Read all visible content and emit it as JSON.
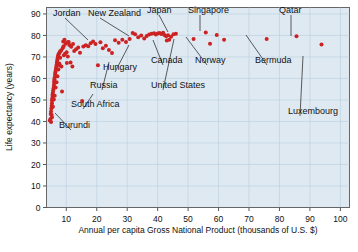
{
  "figure": {
    "title": "",
    "background_color": "#ffffff",
    "plot_background_color": "#dfe9f2",
    "point_color": "#cc2222",
    "grid_color": "#b9cfdd"
  },
  "chart_data": {
    "type": "scatter",
    "title": "",
    "xlabel": "Annual per capita Gross National Product (thousands of U.S. $)",
    "ylabel": "Life expectancy (years)",
    "xlim": [
      3.5,
      103
    ],
    "ylim": [
      0,
      93
    ],
    "xticks": [
      10,
      20,
      30,
      40,
      50,
      60,
      70,
      80,
      90,
      100
    ],
    "yticks": [
      0,
      10,
      20,
      30,
      40,
      50,
      60,
      70,
      80,
      90
    ],
    "grid": true,
    "legend": "none",
    "series": [
      {
        "name": "Countries",
        "points": [
          [
            4.6,
            40.5
          ],
          [
            4.8,
            41.2
          ],
          [
            4.9,
            43.5
          ],
          [
            5.0,
            44.6
          ],
          [
            5.1,
            46.0
          ],
          [
            5.2,
            47.3
          ],
          [
            5.3,
            48.5
          ],
          [
            5.3,
            49.8
          ],
          [
            5.4,
            50.8
          ],
          [
            5.5,
            51.8
          ],
          [
            5.5,
            52.6
          ],
          [
            5.6,
            53.4
          ],
          [
            5.7,
            54.4
          ],
          [
            5.8,
            55.3
          ],
          [
            5.9,
            56.5
          ],
          [
            6.0,
            57.6
          ],
          [
            6.0,
            58.6
          ],
          [
            6.1,
            59.6
          ],
          [
            6.2,
            60.6
          ],
          [
            6.3,
            61.8
          ],
          [
            6.4,
            62.8
          ],
          [
            6.5,
            63.6
          ],
          [
            6.6,
            64.5
          ],
          [
            6.7,
            65.3
          ],
          [
            6.8,
            66.3
          ],
          [
            6.9,
            67.3
          ],
          [
            7.0,
            68.2
          ],
          [
            7.1,
            69.0
          ],
          [
            7.2,
            69.8
          ],
          [
            7.3,
            70.4
          ],
          [
            7.4,
            71.0
          ],
          [
            7.6,
            71.6
          ],
          [
            7.8,
            72.1
          ],
          [
            8.0,
            72.6
          ],
          [
            8.3,
            73.0
          ],
          [
            5.2,
            43.0
          ],
          [
            5.6,
            46.8
          ],
          [
            5.9,
            50.2
          ],
          [
            6.2,
            52.0
          ],
          [
            6.5,
            55.8
          ],
          [
            6.8,
            58.2
          ],
          [
            7.1,
            61.0
          ],
          [
            7.4,
            64.2
          ],
          [
            7.7,
            67.0
          ],
          [
            8.0,
            69.6
          ],
          [
            8.6,
            53.9
          ],
          [
            9.2,
            70.8
          ],
          [
            9.6,
            71.5
          ],
          [
            10.1,
            72.2
          ],
          [
            10.5,
            70.2
          ],
          [
            9.0,
            77.2
          ],
          [
            9.4,
            78.0
          ],
          [
            9.8,
            76.2
          ],
          [
            10.4,
            76.8
          ],
          [
            11.0,
            75.6
          ],
          [
            11.6,
            74.8
          ],
          [
            12.0,
            65.6
          ],
          [
            12.6,
            72.8
          ],
          [
            13.2,
            73.6
          ],
          [
            13.9,
            74.4
          ],
          [
            14.5,
            72.0
          ],
          [
            15.2,
            49.5
          ],
          [
            15.6,
            74.9
          ],
          [
            16.4,
            75.4
          ],
          [
            17.2,
            75.0
          ],
          [
            18.0,
            76.4
          ],
          [
            18.8,
            77.2
          ],
          [
            19.6,
            76.0
          ],
          [
            20.4,
            66.2
          ],
          [
            21.2,
            76.8
          ],
          [
            22.0,
            74.0
          ],
          [
            23.0,
            75.2
          ],
          [
            24.0,
            73.2
          ],
          [
            25.0,
            71.8
          ],
          [
            26.0,
            77.8
          ],
          [
            27.2,
            76.6
          ],
          [
            28.4,
            78.0
          ],
          [
            29.6,
            77.0
          ],
          [
            30.8,
            78.4
          ],
          [
            31.8,
            81.2
          ],
          [
            32.6,
            80.6
          ],
          [
            33.6,
            79.2
          ],
          [
            34.6,
            80.0
          ],
          [
            35.6,
            78.6
          ],
          [
            36.4,
            79.8
          ],
          [
            37.2,
            80.4
          ],
          [
            38.0,
            80.8
          ],
          [
            38.8,
            81.0
          ],
          [
            39.4,
            80.5
          ],
          [
            40.0,
            80.9
          ],
          [
            40.6,
            81.1
          ],
          [
            41.2,
            80.7
          ],
          [
            41.8,
            81.3
          ],
          [
            42.2,
            80.2
          ],
          [
            42.8,
            79.6
          ],
          [
            43.4,
            80.1
          ],
          [
            43.8,
            78.0
          ],
          [
            44.4,
            79.4
          ],
          [
            45.2,
            80.6
          ],
          [
            46.0,
            80.8
          ],
          [
            43.0,
            77.6
          ],
          [
            51.8,
            78.4
          ],
          [
            55.8,
            81.4
          ],
          [
            57.2,
            76.2
          ],
          [
            59.4,
            80.2
          ],
          [
            61.8,
            78.0
          ],
          [
            75.8,
            78.4
          ],
          [
            85.6,
            79.6
          ],
          [
            93.8,
            75.8
          ],
          [
            8.8,
            74.0
          ],
          [
            9.1,
            75.0
          ],
          [
            10.8,
            77.0
          ],
          [
            12.2,
            76.0
          ],
          [
            7.9,
            66.0
          ],
          [
            8.4,
            65.6
          ],
          [
            10.2,
            67.2
          ],
          [
            11.4,
            67.4
          ],
          [
            5.0,
            39.8
          ],
          [
            5.3,
            42.0
          ]
        ]
      }
    ],
    "annotations": [
      {
        "label": "Jordan",
        "lx": 53,
        "ly": 16,
        "px": 88,
        "py": 40
      },
      {
        "label": "New Zealand",
        "lx": 88,
        "ly": 16,
        "px": 129,
        "py": 36
      },
      {
        "label": "Japan",
        "lx": 147,
        "ly": 13,
        "px": 168,
        "py": 32
      },
      {
        "label": "Singapore",
        "lx": 188,
        "ly": 13,
        "px": 200,
        "py": 31
      },
      {
        "label": "Qatar",
        "lx": 279,
        "ly": 13,
        "px": 291,
        "py": 36
      },
      {
        "label": "Hungary",
        "lx": 103,
        "ly": 70,
        "px": 129,
        "py": 45
      },
      {
        "label": "Canada",
        "lx": 151,
        "ly": 63,
        "px": 153,
        "py": 40
      },
      {
        "label": "Norway",
        "lx": 195,
        "ly": 63,
        "px": 186,
        "py": 37
      },
      {
        "label": "Bermuda",
        "lx": 255,
        "ly": 63,
        "px": 246,
        "py": 35
      },
      {
        "label": "Russia",
        "lx": 90,
        "ly": 88,
        "px": 109,
        "py": 62
      },
      {
        "label": "United States",
        "lx": 151,
        "ly": 88,
        "px": 174,
        "py": 39
      },
      {
        "label": "Luxembourg",
        "lx": 288,
        "ly": 114,
        "px": 303,
        "py": 56
      },
      {
        "label": "South Africa",
        "lx": 71,
        "ly": 107,
        "px": 93,
        "py": 94
      },
      {
        "label": "Burundi",
        "lx": 59,
        "ly": 128,
        "px": 55,
        "py": 113
      }
    ]
  },
  "axes": {
    "x_tick_labels": [
      "10",
      "20",
      "30",
      "40",
      "50",
      "60",
      "70",
      "80",
      "90",
      "100"
    ],
    "y_tick_labels": [
      "0",
      "10",
      "20",
      "30",
      "40",
      "50",
      "60",
      "70",
      "80",
      "90"
    ],
    "x_title": "Annual per capita Gross National Product (thousands of U.S. $)",
    "y_title": "Life expectancy (years)"
  }
}
